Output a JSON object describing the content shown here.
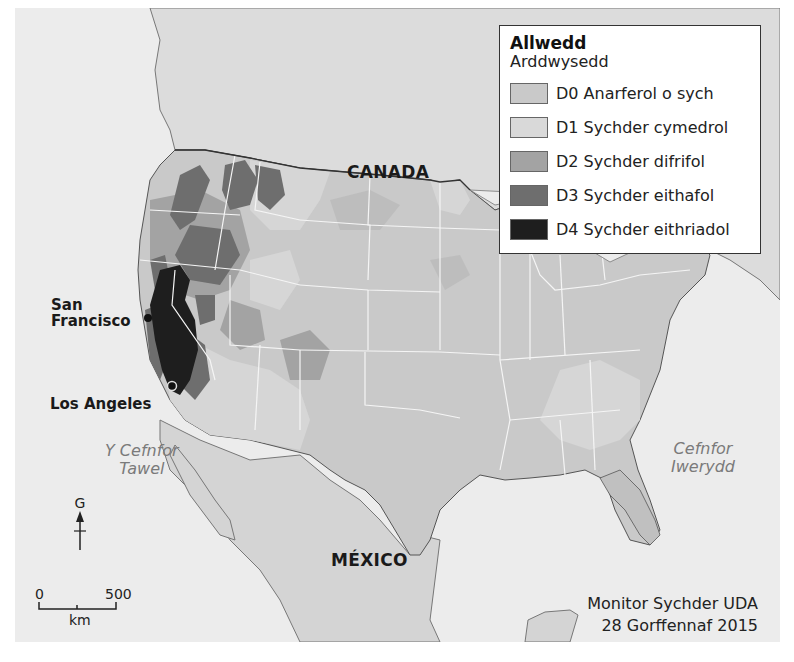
{
  "map": {
    "labels": {
      "canada": "CANADA",
      "mexico": "MÉXICO",
      "pacific_line1": "Y Cefnfor",
      "pacific_line2": "Tawel",
      "atlantic_line1": "Cefnfor",
      "atlantic_line2": "Iwerydd"
    },
    "cities": [
      {
        "name_line1": "San",
        "name_line2": "Francisco"
      },
      {
        "name": "Los Angeles"
      }
    ],
    "north_arrow": {
      "label": "G"
    },
    "scale": {
      "start": "0",
      "end": "500",
      "unit": "km"
    },
    "source": {
      "line1": "Monitor Sychder UDA",
      "line2": "28 Gorffennaf 2015"
    },
    "colors": {
      "ocean": "#ececec",
      "land_other": "#dcdcdc",
      "d0": "#c9c9c9",
      "d1": "#d6d6d6",
      "d2": "#a3a3a3",
      "d3": "#6e6e6e",
      "d4": "#1e1e1e",
      "state_borders": "#f5f5f5"
    }
  },
  "legend": {
    "title": "Allwedd",
    "subtitle": "Arddwysedd",
    "items": [
      {
        "code": "D0",
        "label": "D0 Anarferol o sych",
        "color": "#c9c9c9"
      },
      {
        "code": "D1",
        "label": "D1 Sychder cymedrol",
        "color": "#d9d9d9"
      },
      {
        "code": "D2",
        "label": "D2 Sychder difrifol",
        "color": "#a3a3a3"
      },
      {
        "code": "D3",
        "label": "D3 Sychder eithafol",
        "color": "#6e6e6e"
      },
      {
        "code": "D4",
        "label": "D4 Sychder eithriadol",
        "color": "#1e1e1e"
      }
    ]
  }
}
